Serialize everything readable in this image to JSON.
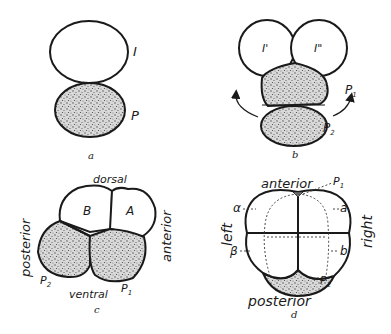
{
  "figure": {
    "panels": [
      {
        "id": "a",
        "caption": "a",
        "labels": {
          "upper_cell": "I",
          "lower_cell": "P"
        }
      },
      {
        "id": "b",
        "caption": "b",
        "labels": {
          "left_cell": "I'",
          "right_cell": "I\"",
          "p1": "P",
          "p1_sub": "1",
          "p2": "P",
          "p2_sub": "2"
        }
      },
      {
        "id": "c",
        "caption": "c",
        "labels": {
          "top": "dorsal",
          "bottom": "ventral",
          "left": "posterior",
          "right": "anterior",
          "cell_b": "B",
          "cell_a": "A",
          "p2": "P",
          "p2_sub": "2",
          "p1": "P",
          "p1_sub": "1"
        }
      },
      {
        "id": "d",
        "caption": "d",
        "labels": {
          "top": "anterior",
          "bottom": "posterior",
          "left": "left",
          "right": "right",
          "alpha": "α",
          "beta": "β",
          "a": "a",
          "b": "b",
          "p1": "P",
          "p1_sub": "1",
          "p2": "P",
          "p2_sub": "2"
        }
      }
    ],
    "colors": {
      "ink": "#1a1a1a",
      "paper": "#ffffff"
    }
  }
}
